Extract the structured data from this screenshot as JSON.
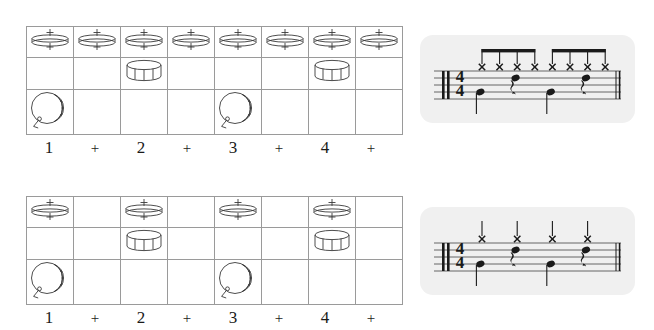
{
  "counts": [
    "1",
    "+",
    "2",
    "+",
    "3",
    "+",
    "4",
    "+"
  ],
  "instrument_rows": [
    {
      "name": "hi-hat",
      "icon": "hihat-cymbal-icon"
    },
    {
      "name": "snare",
      "icon": "snare-drum-icon"
    },
    {
      "name": "bass",
      "icon": "bass-drum-icon"
    }
  ],
  "colors": {
    "grid_line": "#9a9a9a",
    "ink": "#1a1a1a",
    "panel_background": "#f0f0f0",
    "staff_line": "#555555"
  },
  "exercises": [
    {
      "id": "exercise-1",
      "grid": {
        "hihat": [
          true,
          true,
          true,
          true,
          true,
          true,
          true,
          true
        ],
        "snare": [
          false,
          false,
          true,
          false,
          false,
          false,
          true,
          false
        ],
        "bass": [
          true,
          false,
          false,
          false,
          true,
          false,
          false,
          false
        ]
      },
      "notation": {
        "time_signature": {
          "numerator": "4",
          "denominator": "4"
        },
        "clef": "drum-clef",
        "hihat_note_value": "eighth",
        "hihat_beats": [
          "1",
          "+",
          "2",
          "+",
          "3",
          "+",
          "4",
          "+"
        ],
        "beam_groups": [
          [
            0,
            1,
            2,
            3
          ],
          [
            4,
            5,
            6,
            7
          ]
        ],
        "snare_beats": [
          "2",
          "4"
        ],
        "bass_beats": [
          "1",
          "3"
        ],
        "rest_beats": [
          "2",
          "4"
        ],
        "rest_type": "quarter-rest",
        "end_barline": "double"
      }
    },
    {
      "id": "exercise-2",
      "grid": {
        "hihat": [
          true,
          false,
          true,
          false,
          true,
          false,
          true,
          false
        ],
        "snare": [
          false,
          false,
          true,
          false,
          false,
          false,
          true,
          false
        ],
        "bass": [
          true,
          false,
          false,
          false,
          true,
          false,
          false,
          false
        ]
      },
      "notation": {
        "time_signature": {
          "numerator": "4",
          "denominator": "4"
        },
        "clef": "drum-clef",
        "hihat_note_value": "quarter",
        "hihat_beats": [
          "1",
          "2",
          "3",
          "4"
        ],
        "beam_groups": [],
        "snare_beats": [
          "2",
          "4"
        ],
        "bass_beats": [
          "1",
          "3"
        ],
        "rest_beats": [
          "2",
          "4"
        ],
        "rest_type": "quarter-rest",
        "end_barline": "double"
      }
    }
  ]
}
